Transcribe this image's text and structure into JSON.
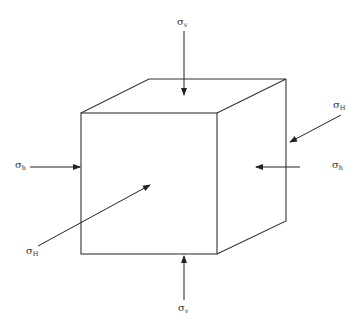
{
  "diagram": {
    "type": "stress-cube",
    "stroke_color": "#333333",
    "background": "#ffffff"
  },
  "labels": {
    "sigma_v_top": {
      "symbol": "σ",
      "subscript": "v"
    },
    "sigma_H_right": {
      "symbol": "σ",
      "subscript": "H"
    },
    "sigma_h_left": {
      "symbol": "σ",
      "subscript": "h"
    },
    "sigma_h_right": {
      "symbol": "σ",
      "subscript": "h"
    },
    "sigma_H_left": {
      "symbol": "σ",
      "subscript": "H"
    },
    "sigma_v_bottom": {
      "symbol": "σ",
      "subscript": "v"
    }
  }
}
